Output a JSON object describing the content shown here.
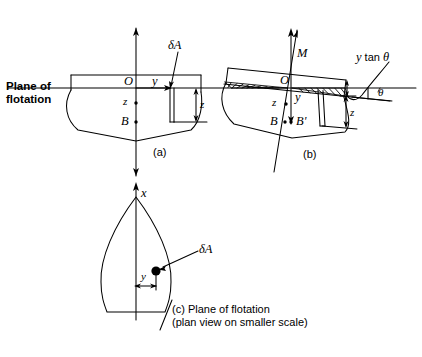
{
  "figure": {
    "stroke_color": "#000000",
    "background_color": "#ffffff"
  },
  "panel_a": {
    "caption": "(a)",
    "plane_label_line1": "Plane of",
    "plane_label_line2": "flotation",
    "origin_label": "O",
    "y_axis_label": "y",
    "z_label": "z",
    "buoyancy_label": "B",
    "area_label": "δA",
    "z_dimension_label": "z"
  },
  "panel_b": {
    "caption": "(b)",
    "metacentre_label": "M",
    "origin_label": "O",
    "y_axis_label": "y",
    "z_label": "z",
    "buoyancy_label": "B",
    "buoyancy_shifted_label": "B'",
    "wedge_label_prefix": "y",
    "wedge_label_suffix": " tan ",
    "wedge_label_theta": "θ",
    "angle_label": "θ",
    "z_dimension_label": "z"
  },
  "panel_c": {
    "caption_line1": "(c) Plane of flotation",
    "caption_line2": "(plan view on smaller scale)",
    "x_axis_label": "x",
    "area_label": "δA",
    "y_dimension_label": "y"
  }
}
